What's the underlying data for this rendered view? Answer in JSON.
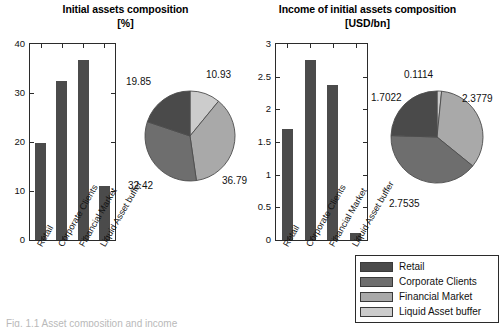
{
  "figure": {
    "caption_fragment": "Fig. 1.1 Asset composition and income",
    "categories": [
      "Retail",
      "Corporate Clients",
      "Financial Market",
      "Liquid Asset buffer"
    ],
    "colors": {
      "retail": "#4a4a4a",
      "corporate_clients": "#6e6e6e",
      "financial_market": "#a9a9a9",
      "liquid_asset_buffer": "#cccccc",
      "bar_fill": "#4b4b4b",
      "axis": "#2b2b2b",
      "text": "#111111",
      "background": "#ffffff"
    }
  },
  "legend": {
    "items": [
      {
        "label": "Retail",
        "color": "#4a4a4a"
      },
      {
        "label": "Corporate Clients",
        "color": "#6e6e6e"
      },
      {
        "label": "Financial Market",
        "color": "#a9a9a9"
      },
      {
        "label": "Liquid Asset buffer",
        "color": "#cccccc"
      }
    ]
  },
  "panels": {
    "left": {
      "title": "Initial assets composition",
      "subtitle": "[%]"
    },
    "right": {
      "title": "Income of initial assets composition",
      "subtitle": "[USD/bn]"
    }
  },
  "chart_data": [
    {
      "id": "initial-assets-bar",
      "type": "bar",
      "title": "Initial assets composition",
      "subtitle": "[%]",
      "xlabel": "",
      "ylabel": "",
      "unit": "%",
      "categories": [
        "Retail",
        "Corporate Clients",
        "Financial Market",
        "Liquid Asset buffer"
      ],
      "values": [
        19.85,
        32.42,
        36.79,
        10.93
      ],
      "ylim": [
        0,
        40
      ],
      "yticks": [
        0,
        10,
        20,
        30,
        40
      ],
      "ytick_labels": [
        "0",
        "10",
        "20",
        "30",
        "40"
      ],
      "grid": false,
      "legend_position": "external-bottom-right"
    },
    {
      "id": "initial-assets-pie",
      "type": "pie",
      "title": "Initial assets composition",
      "subtitle": "[%]",
      "unit": "%",
      "labels": [
        "Liquid Asset buffer",
        "Financial Market",
        "Corporate Clients",
        "Retail"
      ],
      "values": [
        10.93,
        36.79,
        32.42,
        19.85
      ],
      "colors": [
        "#cccccc",
        "#a9a9a9",
        "#6e6e6e",
        "#4a4a4a"
      ],
      "annotations": [
        "10.93",
        "36.79",
        "32.42",
        "19.85"
      ],
      "start_angle_deg": 0,
      "direction": "clockwise"
    },
    {
      "id": "income-assets-bar",
      "type": "bar",
      "title": "Income of initial assets composition",
      "subtitle": "[USD/bn]",
      "xlabel": "",
      "ylabel": "",
      "unit": "USD/bn",
      "categories": [
        "Retail",
        "Corporate Clients",
        "Financial Market",
        "Liquid Asset buffer"
      ],
      "values": [
        1.7022,
        2.7535,
        2.3779,
        0.1114
      ],
      "ylim": [
        0,
        3
      ],
      "yticks": [
        0,
        0.5,
        1,
        1.5,
        2,
        2.5,
        3
      ],
      "ytick_labels": [
        "0",
        "0.5",
        "1",
        "1.5",
        "2",
        "2.5",
        "3"
      ],
      "grid": false,
      "legend_position": "external-bottom-right"
    },
    {
      "id": "income-assets-pie",
      "type": "pie",
      "title": "Income of initial assets composition",
      "subtitle": "[USD/bn]",
      "unit": "USD/bn",
      "labels": [
        "Liquid Asset buffer",
        "Financial Market",
        "Corporate Clients",
        "Retail"
      ],
      "values": [
        0.1114,
        2.3779,
        2.7535,
        1.7022
      ],
      "colors": [
        "#cccccc",
        "#a9a9a9",
        "#6e6e6e",
        "#4a4a4a"
      ],
      "annotations": [
        "0.1114",
        "2.3779",
        "2.7535",
        "1.7022"
      ],
      "start_angle_deg": 0,
      "direction": "clockwise"
    }
  ]
}
